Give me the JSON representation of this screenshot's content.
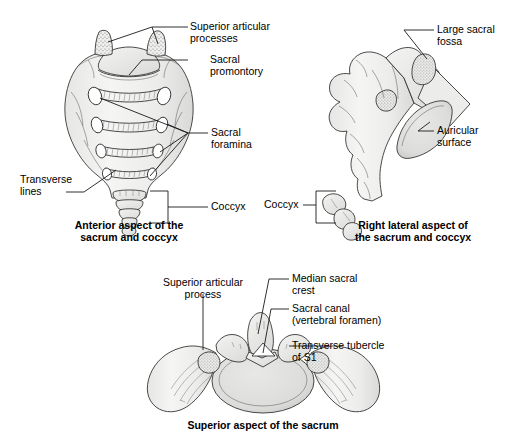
{
  "figure": {
    "background_color": "#ffffff",
    "line_color": "#1a1a1a",
    "bone_fill_light": "#f2f2f1",
    "bone_fill_mid": "#e2e2e0",
    "bone_fill_dark": "#cfcfcd",
    "stipple_color": "#8a8a88"
  },
  "panels": [
    {
      "id": "anterior",
      "caption_line1": "Anterior aspect of the",
      "caption_line2": "sacrum and coccyx",
      "labels": [
        {
          "id": "superior-articular-processes",
          "line1": "Superior articular",
          "line2": "processes"
        },
        {
          "id": "sacral-promontory",
          "line1": "Sacral",
          "line2": "promontory"
        },
        {
          "id": "sacral-foramina",
          "line1": "Sacral",
          "line2": "foramina"
        },
        {
          "id": "transverse-lines",
          "line1": "Transverse",
          "line2": "lines"
        },
        {
          "id": "coccyx",
          "line1": "Coccyx",
          "line2": ""
        }
      ]
    },
    {
      "id": "right-lateral",
      "caption_line1": "Right lateral aspect of",
      "caption_line2": "the sacrum and coccyx",
      "labels": [
        {
          "id": "large-sacral-fossa",
          "line1": "Large sacral",
          "line2": "fossa"
        },
        {
          "id": "auricular-surface",
          "line1": "Auricular",
          "line2": "surface"
        },
        {
          "id": "coccyx",
          "line1": "Coccyx",
          "line2": ""
        }
      ]
    },
    {
      "id": "superior",
      "caption_line1": "Superior aspect of the sacrum",
      "caption_line2": "",
      "labels": [
        {
          "id": "superior-articular-process",
          "line1": "Superior articular",
          "line2": "process"
        },
        {
          "id": "median-sacral-crest",
          "line1": "Median sacral",
          "line2": "crest"
        },
        {
          "id": "sacral-canal",
          "line1": "Sacral canal",
          "line2": "(vertebral foramen)"
        },
        {
          "id": "transverse-tubercle-of-s1",
          "line1": "Transverse tubercle",
          "line2": "of S1"
        }
      ]
    }
  ]
}
